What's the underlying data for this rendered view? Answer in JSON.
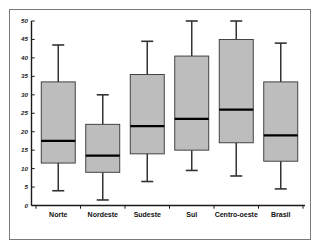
{
  "chart_data": {
    "type": "box",
    "title": "",
    "xlabel": "",
    "ylabel": "",
    "ylim": [
      0,
      50
    ],
    "yticks": [
      0,
      5,
      10,
      15,
      20,
      25,
      30,
      35,
      40,
      45,
      50
    ],
    "ytick_labels": [
      "0",
      "5",
      "10",
      "15",
      "20",
      "25",
      "30",
      "35",
      "40",
      "45",
      "50"
    ],
    "grid": false,
    "legend": "none",
    "categories": [
      "Norte",
      "Nordeste",
      "Sudeste",
      "Sul",
      "Centro-oeste",
      "Brasil"
    ],
    "boxes": [
      {
        "label": "Norte",
        "min": 4.0,
        "q1": 11.5,
        "median": 17.5,
        "q3": 33.5,
        "max": 43.5
      },
      {
        "label": "Nordeste",
        "min": 1.5,
        "q1": 9.0,
        "median": 13.5,
        "q3": 22.0,
        "max": 30.0
      },
      {
        "label": "Sudeste",
        "min": 6.5,
        "q1": 14.0,
        "median": 21.5,
        "q3": 35.5,
        "max": 44.5
      },
      {
        "label": "Sul",
        "min": 9.5,
        "q1": 15.0,
        "median": 23.5,
        "q3": 40.5,
        "max": 50.0
      },
      {
        "label": "Centro-oeste",
        "min": 8.0,
        "q1": 17.0,
        "median": 26.0,
        "q3": 45.0,
        "max": 50.0
      },
      {
        "label": "Brasil",
        "min": 4.5,
        "q1": 12.0,
        "median": 19.0,
        "q3": 33.5,
        "max": 44.0
      }
    ],
    "colors": {
      "box_fill": "#bdbdbd",
      "box_edge": "#333333",
      "median": "#000000",
      "whisker": "#333333",
      "axis": "#1a1a1a",
      "frame": "#7a7a7a",
      "background": "#ffffff"
    }
  }
}
